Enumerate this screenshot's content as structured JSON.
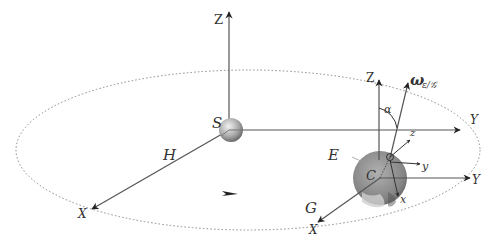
{
  "diagram": {
    "labels": {
      "sun_axis_z": "Z",
      "sun_axis_x": "X",
      "sun_axis_y": "Y",
      "sun": "S",
      "heliocentric_frame": "H",
      "earth_axis_z": "Z",
      "earth_axis_x": "X",
      "earth_axis_y": "Y",
      "earth": "E",
      "earth_center": "C",
      "geocentric_frame": "G",
      "omega": "ω",
      "omega_sub": "ε/𝒢",
      "alpha": "α",
      "local_z": "z",
      "local_y": "y",
      "local_x": "x"
    },
    "colors": {
      "line": "#4a4a4a",
      "orbit": "#888888",
      "sun_fill": "#b8b8b8",
      "earth_fill": "#8c8c8c",
      "text": "#333333"
    }
  }
}
